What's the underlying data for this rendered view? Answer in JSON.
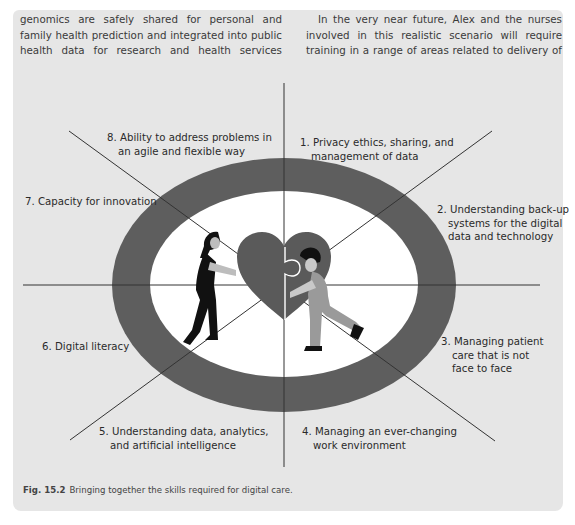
{
  "body_text": {
    "left_paragraph": "genomics are safely shared for personal and family health prediction and integrated into public health data for research and health services improvement.",
    "right_paragraph": "In the very near future, Alex and the nurses involved in this realistic scenario will require training in a range of areas related to delivery of digital health (➤ Fig. 15.2)."
  },
  "figure": {
    "caption_number": "Fig. 15.2",
    "caption_text": "Bringing together the skills required for digital care.",
    "center_image": "two people pushing jigsaw heart pieces together",
    "colors": {
      "background": "#e6e6e6",
      "outer_ring": "#5e5e5e",
      "inner_ellipse": "#ffffff",
      "heart": "#5a5a5a",
      "lines": "#333333"
    },
    "skills": [
      {
        "number": "1.",
        "line1": "Privacy ethics, sharing, and",
        "line2": "management of data",
        "line3": ""
      },
      {
        "number": "2.",
        "line1": "Understanding back-up",
        "line2": "systems for the digital",
        "line3": "data and technology"
      },
      {
        "number": "3.",
        "line1": "Managing patient",
        "line2": "care that is not",
        "line3": "face to face"
      },
      {
        "number": "4.",
        "line1": "Managing an ever-changing",
        "line2": "work environment",
        "line3": ""
      },
      {
        "number": "5.",
        "line1": "Understanding data, analytics,",
        "line2": "and artificial intelligence",
        "line3": ""
      },
      {
        "number": "6.",
        "line1": "Digital literacy",
        "line2": "",
        "line3": ""
      },
      {
        "number": "7.",
        "line1": "Capacity for innovation",
        "line2": "",
        "line3": ""
      },
      {
        "number": "8.",
        "line1": "Ability to address problems in",
        "line2": "an agile and flexible way",
        "line3": ""
      }
    ]
  }
}
